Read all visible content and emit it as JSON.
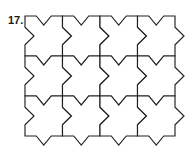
{
  "figure": {
    "label": "17.",
    "label_name": "problem-number-17",
    "type": "tessellation",
    "tile_shape_name": "six-pointed-star-tile",
    "rows": 3,
    "columns": 4,
    "cell_width": 37.5,
    "cell_height": 40,
    "grid_origin_x": 25,
    "grid_origin_y": 16,
    "stroke_color": "#231f20",
    "fill_color": "#ffffff",
    "background_color": "#ffffff",
    "stroke_width": 1.15,
    "notch_depth_vertical": 9,
    "notch_depth_horizontal": 9,
    "tile_unit_path_description": "Closed polygon per cell: top edge with inward V notch, right edge with outward arrow point, bottom edge with outward V point, left edge with inward arrow notch"
  }
}
